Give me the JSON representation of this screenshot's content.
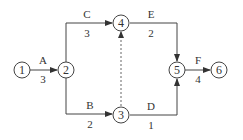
{
  "diagram": {
    "type": "activity-on-arrow network",
    "nodes": [
      {
        "id": "1",
        "label": "1"
      },
      {
        "id": "2",
        "label": "2"
      },
      {
        "id": "3",
        "label": "3"
      },
      {
        "id": "4",
        "label": "4"
      },
      {
        "id": "5",
        "label": "5"
      },
      {
        "id": "6",
        "label": "6"
      }
    ],
    "edges": [
      {
        "from": "1",
        "to": "2",
        "activity": "A",
        "duration": "3",
        "style": "solid"
      },
      {
        "from": "2",
        "to": "4",
        "activity": "C",
        "duration": "3",
        "style": "solid"
      },
      {
        "from": "2",
        "to": "3",
        "activity": "B",
        "duration": "2",
        "style": "solid"
      },
      {
        "from": "3",
        "to": "4",
        "activity": "",
        "duration": "",
        "style": "dashed"
      },
      {
        "from": "4",
        "to": "5",
        "activity": "E",
        "duration": "2",
        "style": "solid"
      },
      {
        "from": "3",
        "to": "5",
        "activity": "D",
        "duration": "1",
        "style": "solid"
      },
      {
        "from": "5",
        "to": "6",
        "activity": "F",
        "duration": "4",
        "style": "solid"
      }
    ]
  }
}
